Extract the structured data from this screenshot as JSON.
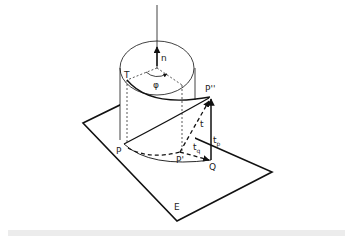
{
  "figure": {
    "labels": {
      "n": "n",
      "T": "T",
      "phi": "φ",
      "P_double_prime": "P''",
      "t": "t",
      "t_p": "t",
      "t_p_sub": "p",
      "t_q": "t",
      "t_q_sub": "q",
      "P": "P",
      "P_prime": "P'",
      "Q": "Q",
      "E": "E"
    },
    "colors": {
      "line": "#111111",
      "label": "#222222",
      "background": "#ffffff",
      "caption_bar": "#ececec"
    }
  }
}
